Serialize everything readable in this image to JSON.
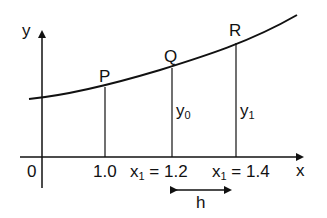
{
  "diagram": {
    "axes": {
      "x_label": "x",
      "y_label": "y",
      "origin_label": "0"
    },
    "points": [
      {
        "name": "P",
        "x_value": "1.0"
      },
      {
        "name": "Q",
        "x_value": "1.2",
        "ordinate": "y0"
      },
      {
        "name": "R",
        "x_value": "1.4",
        "ordinate": "y1"
      }
    ],
    "tick_labels": {
      "t1": "1.0",
      "t2_var": "x",
      "t2_sub": "1",
      "t2_rest": " = 1.2",
      "t3_var": "x",
      "t3_sub": "1",
      "t3_rest": " = 1.4"
    },
    "ordinates": {
      "y0_var": "y",
      "y0_sub": "0",
      "y1_var": "y",
      "y1_sub": "1"
    },
    "step_label": "h",
    "colors": {
      "line": "#111111",
      "background": "#ffffff"
    }
  }
}
